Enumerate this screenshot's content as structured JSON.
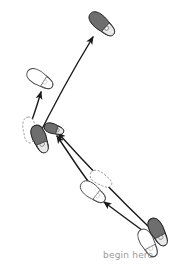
{
  "figure": {
    "kind": "footstep-path-diagram",
    "background_color": "#ffffff",
    "canvas": {
      "width": 186,
      "height": 276
    }
  },
  "palette": {
    "filled_foot_fill": "#6e6e6e",
    "filled_foot_stroke": "#1a1a1a",
    "open_foot_fill": "#ffffff",
    "open_foot_stroke": "#4a4a4a",
    "ghost_foot_stroke": "#8d8d8d",
    "arrow_color": "#1a1a1a",
    "caption_color": "#9a9a9a",
    "sole_detail_color": "#bdbdbd"
  },
  "labels": [
    {
      "id": "begin-here",
      "text": "begin here",
      "x": 103,
      "y": 250,
      "color": "#9a9a9a",
      "font_size": 9
    }
  ],
  "footprints": [
    {
      "id": "start-dark-foot",
      "name": "start-right-foot-filled",
      "style": "filled",
      "cx": 158,
      "cy": 232,
      "length": 30,
      "width": 14,
      "rotation": -28,
      "z": 4
    },
    {
      "id": "start-open-foot",
      "name": "start-left-foot-open",
      "style": "open",
      "cx": 148,
      "cy": 243,
      "length": 30,
      "width": 14,
      "rotation": -28,
      "z": 3
    },
    {
      "id": "mid-open-foot",
      "name": "middle-left-foot-open",
      "style": "open",
      "cx": 93,
      "cy": 192,
      "length": 29,
      "width": 14,
      "rotation": -52,
      "z": 3
    },
    {
      "id": "mid-ghost-foot",
      "name": "middle-ghost-foot-dashed",
      "style": "ghost",
      "cx": 101,
      "cy": 179,
      "length": 24,
      "width": 12,
      "rotation": -58,
      "z": 2
    },
    {
      "id": "pivot-dark-foot",
      "name": "pivot-foot-filled-large",
      "style": "filled",
      "cx": 40,
      "cy": 139,
      "length": 29,
      "width": 14,
      "rotation": -22,
      "z": 4
    },
    {
      "id": "pivot-small-dark-foot",
      "name": "pivot-foot-filled-small",
      "style": "filled",
      "cx": 54,
      "cy": 129,
      "length": 20,
      "width": 10,
      "rotation": -72,
      "z": 5
    },
    {
      "id": "pivot-ghost-foot",
      "name": "pivot-ghost-foot-dashed",
      "style": "ghost",
      "cx": 29,
      "cy": 130,
      "length": 26,
      "width": 12,
      "rotation": -4,
      "z": 2
    },
    {
      "id": "upper-open-foot",
      "name": "upper-left-foot-open",
      "style": "open",
      "cx": 40,
      "cy": 79,
      "length": 29,
      "width": 14,
      "rotation": -58,
      "z": 3
    },
    {
      "id": "top-dark-foot",
      "name": "top-right-foot-filled",
      "style": "filled",
      "cx": 102,
      "cy": 24,
      "length": 31,
      "width": 14,
      "rotation": -48,
      "z": 4
    }
  ],
  "arrows": [
    {
      "id": "arrow-start-to-pivot-upper",
      "name": "arrow-begin-to-pivot-upper",
      "from": [
        150,
        228
      ],
      "control": [
        106,
        186
      ],
      "to": [
        58,
        133
      ],
      "head_at_end": true,
      "width": 1.4
    },
    {
      "id": "arrow-start-to-mid",
      "name": "arrow-begin-to-middle-open-foot",
      "from": [
        150,
        236
      ],
      "control": [
        128,
        220
      ],
      "to": [
        104,
        202
      ],
      "head_at_end": true,
      "width": 1.4
    },
    {
      "id": "arrow-mid-to-pivot",
      "name": "arrow-middle-to-pivot",
      "from": [
        100,
        198
      ],
      "control": [
        78,
        168
      ],
      "to": [
        57,
        136
      ],
      "head_at_end": true,
      "width": 1.4
    },
    {
      "id": "arrow-pivot-to-upper-open",
      "name": "arrow-pivot-to-upper-open-foot",
      "from": [
        26,
        136
      ],
      "control": [
        34,
        116
      ],
      "to": [
        41,
        92
      ],
      "head_at_end": true,
      "width": 1.4
    },
    {
      "id": "arrow-pivot-to-top",
      "name": "arrow-pivot-to-top-filled-foot",
      "from": [
        35,
        143
      ],
      "control": [
        62,
        88
      ],
      "to": [
        93,
        37
      ],
      "head_at_end": true,
      "width": 1.4
    }
  ],
  "accessibility": {
    "description": "A footstep diagram with curved arrows leading from a pair of feet labelled begin here at the lower right, through a central pivot cluster of feet, out to an open foot at the upper left and a filled foot at the top right."
  }
}
